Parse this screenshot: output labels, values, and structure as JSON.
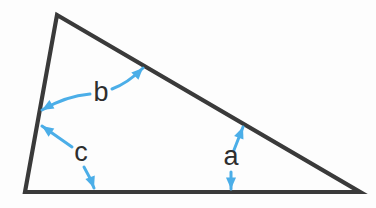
{
  "diagram": {
    "kind": "geometry-figure",
    "canvas": {
      "width": 376,
      "height": 208
    },
    "background_color": "#fdfdfd",
    "shape": {
      "name": "triangle",
      "type": "scalene-triangle",
      "stroke_color": "#3a3a3a",
      "stroke_width": 4.2,
      "fill": "none",
      "vertices": [
        {
          "name": "apex",
          "x": 57,
          "y": 15
        },
        {
          "name": "bottom-right",
          "x": 360,
          "y": 192
        },
        {
          "name": "bottom-left",
          "x": 25,
          "y": 192
        }
      ],
      "sides": [
        {
          "name": "hypotenuse",
          "from": "apex",
          "to": "bottom-right"
        },
        {
          "name": "base",
          "from": "bottom-left",
          "to": "bottom-right"
        },
        {
          "name": "left-side",
          "from": "bottom-left",
          "to": "apex"
        }
      ]
    },
    "arrow_color": "#4BAEE8",
    "arrow_stroke_width": 3.0,
    "labels": [
      {
        "id": "b",
        "text": "b",
        "x": 101,
        "y": 101,
        "font_size": 27,
        "angle_at_vertex": "apex",
        "arrows": [
          {
            "name": "b-arrow-to-left-side",
            "style": "curved",
            "direction": "left",
            "tail": {
              "x": 90,
              "y": 94
            },
            "control": {
              "x": 66,
              "y": 96
            },
            "tip": {
              "x": 42,
              "y": 110
            }
          },
          {
            "name": "b-arrow-to-hypotenuse",
            "style": "curved",
            "direction": "up-right",
            "tail": {
              "x": 112,
              "y": 89
            },
            "control": {
              "x": 128,
              "y": 83
            },
            "tip": {
              "x": 143,
              "y": 68
            }
          }
        ]
      },
      {
        "id": "c",
        "text": "c",
        "x": 81,
        "y": 161,
        "font_size": 27,
        "angle_at_vertex": "bottom-left",
        "arrows": [
          {
            "name": "c-arrow-to-left-side",
            "style": "straight",
            "direction": "up-left",
            "tail": {
              "x": 72,
              "y": 147
            },
            "control": {
              "x": 58,
              "y": 137
            },
            "tip": {
              "x": 42,
              "y": 126
            }
          },
          {
            "name": "c-arrow-to-base",
            "style": "curved",
            "direction": "down-right",
            "tail": {
              "x": 84,
              "y": 167
            },
            "control": {
              "x": 90,
              "y": 177
            },
            "tip": {
              "x": 94,
              "y": 188
            }
          }
        ]
      },
      {
        "id": "a",
        "text": "a",
        "x": 231,
        "y": 165,
        "font_size": 27,
        "angle_at_vertex": "bottom-right",
        "arrows": [
          {
            "name": "a-arrow-to-hypotenuse",
            "style": "straight",
            "direction": "up-right",
            "tail": {
              "x": 234,
              "y": 150
            },
            "control": {
              "x": 238,
              "y": 139
            },
            "tip": {
              "x": 243,
              "y": 127
            }
          },
          {
            "name": "a-arrow-to-base",
            "style": "straight",
            "direction": "down",
            "tail": {
              "x": 231,
              "y": 172
            },
            "control": {
              "x": 231,
              "y": 180
            },
            "tip": {
              "x": 231,
              "y": 189
            }
          }
        ]
      }
    ]
  }
}
